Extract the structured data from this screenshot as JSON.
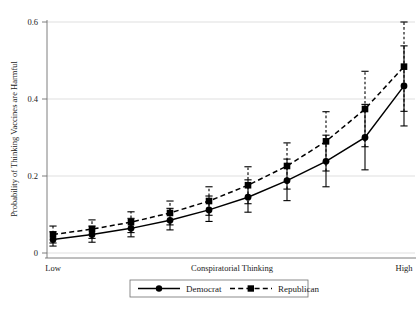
{
  "chart_data": {
    "type": "line",
    "title": "",
    "subtitle": "",
    "xlabel": "Conspiratorial Thinking",
    "ylabel": "Probability of Thinking Vaccines are Harmful",
    "xlim": [
      0,
      9
    ],
    "ylim": [
      0,
      0.6
    ],
    "grid": true,
    "grid_axis": "y",
    "legend_position": "bottom-center",
    "x_tick_labels": [
      "Low",
      "High"
    ],
    "x_tick_positions": [
      0,
      9
    ],
    "y_ticks": [
      0,
      0.2,
      0.4,
      0.6
    ],
    "y_tick_labels": [
      "0",
      "0.2",
      "0.4",
      "0.6"
    ],
    "x": [
      0,
      1,
      2,
      3,
      4,
      5,
      6,
      7,
      8,
      9
    ],
    "series": [
      {
        "name": "Democrat",
        "marker": "circle",
        "linestyle": "solid",
        "values": [
          0.035,
          0.048,
          0.064,
          0.085,
          0.112,
          0.145,
          0.188,
          0.238,
          0.3,
          0.434
        ],
        "ci_low": [
          0.018,
          0.028,
          0.042,
          0.06,
          0.082,
          0.106,
          0.136,
          0.172,
          0.216,
          0.33
        ],
        "ci_high": [
          0.055,
          0.07,
          0.09,
          0.116,
          0.148,
          0.19,
          0.244,
          0.306,
          0.386,
          0.538
        ]
      },
      {
        "name": "Republican",
        "marker": "square",
        "linestyle": "dashed",
        "values": [
          0.048,
          0.062,
          0.08,
          0.104,
          0.135,
          0.176,
          0.226,
          0.29,
          0.374,
          0.484
        ],
        "ci_low": [
          0.026,
          0.038,
          0.053,
          0.073,
          0.098,
          0.128,
          0.166,
          0.213,
          0.276,
          0.368
        ],
        "ci_high": [
          0.07,
          0.086,
          0.107,
          0.135,
          0.172,
          0.224,
          0.286,
          0.367,
          0.472,
          0.6
        ]
      }
    ]
  },
  "axes": {
    "y_title": "Probability of Thinking Vaccines are Harmful",
    "x_title": "Conspiratorial Thinking",
    "x_low_label": "Low",
    "x_high_label": "High",
    "y_tick_0": "0",
    "y_tick_1": "0.2",
    "y_tick_2": "0.4",
    "y_tick_3": "0.6"
  },
  "legend": {
    "item_democrat": "Democrat",
    "item_republican": "Republican"
  },
  "colors": {
    "series": "#000000",
    "grid": "#c9c9c9",
    "frame": "#6f6f6f",
    "background": "#ffffff"
  }
}
